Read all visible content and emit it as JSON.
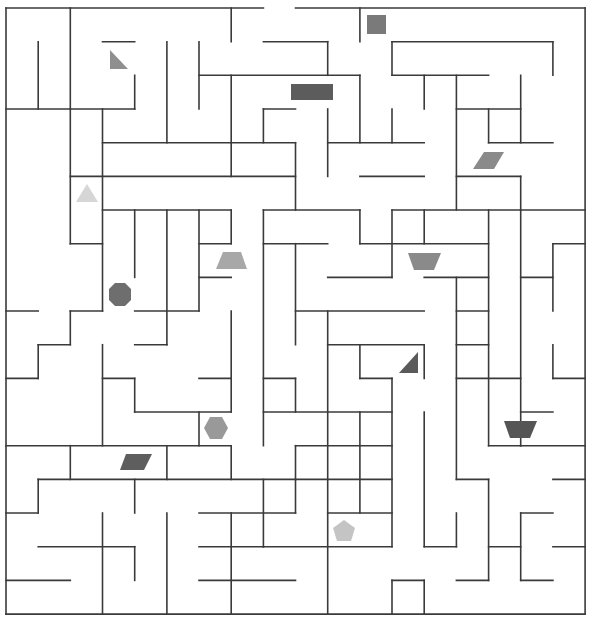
{
  "maze": {
    "cols": 18,
    "rows": 18,
    "origin": [
      6,
      8
    ],
    "cell": [
      32.17,
      33.67
    ],
    "wall_color": "#3a3a3a",
    "background": "#ffffff",
    "entrance": {
      "side": "top",
      "col": 8
    },
    "h_walls": [
      [
        0,
        0,
        8
      ],
      [
        0,
        9,
        18
      ],
      [
        18,
        0,
        18
      ],
      [
        1,
        3,
        4
      ],
      [
        1,
        8,
        10
      ],
      [
        1,
        12,
        17
      ],
      [
        2,
        6,
        11
      ],
      [
        2,
        12,
        15
      ],
      [
        3,
        0,
        2
      ],
      [
        3,
        2,
        4
      ],
      [
        3,
        8,
        9
      ],
      [
        3,
        14,
        16
      ],
      [
        4,
        3,
        7
      ],
      [
        4,
        7,
        9
      ],
      [
        4,
        10,
        13
      ],
      [
        4,
        15,
        17
      ],
      [
        5,
        2,
        9
      ],
      [
        5,
        11,
        13
      ],
      [
        5,
        14,
        16
      ],
      [
        6,
        3,
        7
      ],
      [
        6,
        8,
        11
      ],
      [
        6,
        12,
        18
      ],
      [
        7,
        2,
        3
      ],
      [
        7,
        6,
        7
      ],
      [
        7,
        8,
        10
      ],
      [
        7,
        11,
        15
      ],
      [
        7,
        17,
        18
      ],
      [
        8,
        6,
        7
      ],
      [
        8,
        10,
        12
      ],
      [
        8,
        13,
        15
      ],
      [
        8,
        16,
        17
      ],
      [
        9,
        0,
        1
      ],
      [
        9,
        2,
        3
      ],
      [
        9,
        4,
        6
      ],
      [
        9,
        9,
        13
      ],
      [
        9,
        14,
        15
      ],
      [
        10,
        1,
        2
      ],
      [
        10,
        4,
        5
      ],
      [
        10,
        10,
        13
      ],
      [
        10,
        14,
        15
      ],
      [
        11,
        0,
        1
      ],
      [
        11,
        3,
        4
      ],
      [
        11,
        6,
        7
      ],
      [
        11,
        8,
        9
      ],
      [
        11,
        11,
        12
      ],
      [
        11,
        14,
        16
      ],
      [
        11,
        17,
        18
      ],
      [
        12,
        4,
        7
      ],
      [
        12,
        8,
        12
      ],
      [
        12,
        16,
        17
      ],
      [
        13,
        0,
        7
      ],
      [
        13,
        9,
        12
      ],
      [
        13,
        15,
        16
      ],
      [
        13,
        16,
        18
      ],
      [
        14,
        1,
        9
      ],
      [
        14,
        9,
        12
      ],
      [
        14,
        14,
        15
      ],
      [
        14,
        17,
        18
      ],
      [
        15,
        0,
        1
      ],
      [
        15,
        6,
        9
      ],
      [
        15,
        10,
        12
      ],
      [
        15,
        16,
        17
      ],
      [
        16,
        1,
        4
      ],
      [
        16,
        6,
        8
      ],
      [
        16,
        8,
        12
      ],
      [
        16,
        13,
        14
      ],
      [
        16,
        15,
        16
      ],
      [
        16,
        17,
        18
      ],
      [
        17,
        0,
        2
      ],
      [
        17,
        6,
        9
      ],
      [
        17,
        12,
        13
      ],
      [
        17,
        14,
        15
      ],
      [
        17,
        16,
        17
      ]
    ],
    "v_walls": [
      [
        0,
        0,
        18
      ],
      [
        18,
        0,
        18
      ],
      [
        1,
        1,
        3
      ],
      [
        1,
        10,
        11
      ],
      [
        1,
        14,
        15
      ],
      [
        2,
        0,
        7
      ],
      [
        2,
        9,
        10
      ],
      [
        2,
        13,
        14
      ],
      [
        3,
        3,
        9
      ],
      [
        3,
        10,
        13
      ],
      [
        3,
        15,
        18
      ],
      [
        4,
        2,
        3
      ],
      [
        4,
        6,
        8
      ],
      [
        4,
        11,
        12
      ],
      [
        4,
        14,
        15
      ],
      [
        4,
        16,
        17
      ],
      [
        5,
        1,
        4
      ],
      [
        5,
        6,
        10
      ],
      [
        5,
        13,
        14
      ],
      [
        5,
        15,
        18
      ],
      [
        6,
        1,
        3
      ],
      [
        6,
        6,
        9
      ],
      [
        6,
        12,
        13
      ],
      [
        7,
        0,
        1
      ],
      [
        7,
        2,
        5
      ],
      [
        7,
        6,
        7
      ],
      [
        7,
        9,
        12
      ],
      [
        7,
        13,
        14
      ],
      [
        7,
        15,
        18
      ],
      [
        8,
        3,
        4
      ],
      [
        8,
        6,
        13
      ],
      [
        8,
        14,
        16
      ],
      [
        9,
        4,
        6
      ],
      [
        9,
        7,
        10
      ],
      [
        9,
        11,
        12
      ],
      [
        9,
        13,
        15
      ],
      [
        10,
        1,
        2
      ],
      [
        10,
        3,
        5
      ],
      [
        10,
        9,
        18
      ],
      [
        11,
        0,
        1
      ],
      [
        11,
        2,
        4
      ],
      [
        11,
        6,
        7
      ],
      [
        11,
        10,
        11
      ],
      [
        11,
        12,
        15
      ],
      [
        12,
        1,
        2
      ],
      [
        12,
        3,
        4
      ],
      [
        12,
        6,
        8
      ],
      [
        12,
        11,
        16
      ],
      [
        12,
        17,
        18
      ],
      [
        13,
        2,
        3
      ],
      [
        13,
        6,
        7
      ],
      [
        13,
        10,
        11
      ],
      [
        13,
        12,
        16
      ],
      [
        13,
        17,
        18
      ],
      [
        14,
        2,
        6
      ],
      [
        14,
        8,
        14
      ],
      [
        14,
        15,
        16
      ],
      [
        15,
        3,
        4
      ],
      [
        15,
        6,
        13
      ],
      [
        15,
        14,
        17
      ],
      [
        16,
        2,
        4
      ],
      [
        16,
        5,
        6
      ],
      [
        16,
        6,
        13
      ],
      [
        16,
        15,
        17
      ],
      [
        17,
        1,
        2
      ],
      [
        17,
        7,
        9
      ],
      [
        17,
        10,
        11
      ]
    ]
  },
  "markers": [
    {
      "name": "triangle-right",
      "shape": "right-triangle",
      "points": [
        [
          110,
          50
        ],
        [
          128,
          69
        ],
        [
          110,
          69
        ]
      ],
      "color": "#8f8f8f"
    },
    {
      "name": "square",
      "shape": "square",
      "points": [
        [
          367,
          15
        ],
        [
          386,
          15
        ],
        [
          386,
          34
        ],
        [
          367,
          34
        ]
      ],
      "color": "#7a7a7a"
    },
    {
      "name": "rectangle",
      "shape": "rectangle",
      "points": [
        [
          291,
          84
        ],
        [
          333,
          84
        ],
        [
          333,
          100
        ],
        [
          291,
          100
        ]
      ],
      "color": "#5c5c5c"
    },
    {
      "name": "parallelogram-top-right",
      "shape": "parallelogram",
      "points": [
        [
          484,
          152
        ],
        [
          504,
          152
        ],
        [
          494,
          169
        ],
        [
          473,
          169
        ]
      ],
      "color": "#8a8a8a"
    },
    {
      "name": "triangle-up",
      "shape": "triangle",
      "points": [
        [
          87,
          184
        ],
        [
          98,
          202
        ],
        [
          76,
          202
        ]
      ],
      "color": "#d6d6d6"
    },
    {
      "name": "trapezoid-left",
      "shape": "trapezoid",
      "points": [
        [
          223,
          252
        ],
        [
          241,
          252
        ],
        [
          247,
          269
        ],
        [
          216,
          269
        ]
      ],
      "color": "#a8a8a8"
    },
    {
      "name": "trapezoid-inverted",
      "shape": "trapezoid",
      "points": [
        [
          408,
          253
        ],
        [
          441,
          253
        ],
        [
          434,
          270
        ],
        [
          414,
          270
        ]
      ],
      "color": "#8a8a8a"
    },
    {
      "name": "octagon",
      "shape": "octagon",
      "points": [
        [
          115,
          283
        ],
        [
          125,
          283
        ],
        [
          131,
          289
        ],
        [
          131,
          300
        ],
        [
          125,
          306
        ],
        [
          115,
          306
        ],
        [
          109,
          300
        ],
        [
          109,
          289
        ]
      ],
      "color": "#6e6e6e"
    },
    {
      "name": "triangle-right-mid",
      "shape": "right-triangle",
      "points": [
        [
          418,
          352
        ],
        [
          418,
          373
        ],
        [
          399,
          373
        ]
      ],
      "color": "#5a5a5a"
    },
    {
      "name": "hexagon",
      "shape": "hexagon",
      "points": [
        [
          210,
          417
        ],
        [
          222,
          417
        ],
        [
          228,
          428
        ],
        [
          222,
          439
        ],
        [
          210,
          439
        ],
        [
          204,
          428
        ]
      ],
      "color": "#999999"
    },
    {
      "name": "trapezoid-dark",
      "shape": "trapezoid",
      "points": [
        [
          504,
          421
        ],
        [
          537,
          421
        ],
        [
          530,
          438
        ],
        [
          510,
          438
        ]
      ],
      "color": "#555555"
    },
    {
      "name": "parallelogram-dark",
      "shape": "parallelogram",
      "points": [
        [
          126,
          454
        ],
        [
          152,
          454
        ],
        [
          144,
          470
        ],
        [
          120,
          470
        ]
      ],
      "color": "#5e5e5e"
    },
    {
      "name": "pentagon",
      "shape": "pentagon",
      "points": [
        [
          344,
          520
        ],
        [
          355,
          528
        ],
        [
          351,
          541
        ],
        [
          337,
          541
        ],
        [
          333,
          528
        ]
      ],
      "color": "#c4c4c4"
    }
  ]
}
